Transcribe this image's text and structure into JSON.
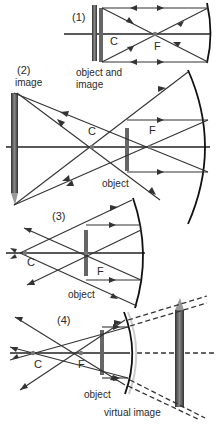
{
  "panels": [
    {
      "number": "(1)",
      "labels": {
        "center": "C",
        "focus": "F",
        "object": "object and",
        "object_line2": "image"
      },
      "case": "object at C"
    },
    {
      "number": "(2)",
      "labels": {
        "center": "C",
        "focus": "F",
        "object": "object",
        "image": "image"
      },
      "case": "object between C and F"
    },
    {
      "number": "(3)",
      "labels": {
        "center": "C",
        "focus": "F",
        "object": "object"
      },
      "case": "object at F"
    },
    {
      "number": "(4)",
      "labels": {
        "center": "C",
        "focus": "F",
        "object": "object",
        "image": "virtual image"
      },
      "case": "object inside F"
    }
  ],
  "colors": {
    "line": "#333333",
    "mirror": "#111111",
    "pencil": "#555555",
    "point": "#777777"
  }
}
